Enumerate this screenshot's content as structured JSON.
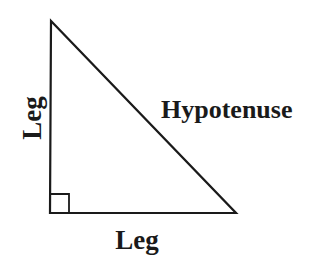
{
  "diagram": {
    "type": "right-triangle",
    "labels": {
      "vertical_leg": "Leg",
      "horizontal_leg": "Leg",
      "hypotenuse": "Hypotenuse"
    },
    "right_angle_marker": true,
    "colors": {
      "stroke": "#1a1a1a",
      "background": "#ffffff"
    }
  }
}
